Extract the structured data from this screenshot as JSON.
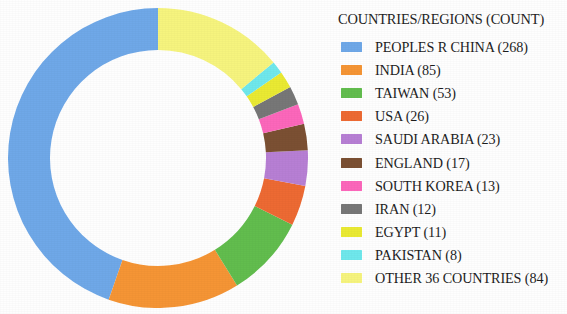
{
  "chart_data": {
    "type": "pie",
    "variant": "donut",
    "title": "COUNTRIES/REGIONS (COUNT)",
    "xlabel": "",
    "ylabel": "",
    "total": 600,
    "direction": "counterclockwise",
    "start_angle_deg": 90,
    "inner_radius_ratio": 0.72,
    "legend_position": "right",
    "grid": false,
    "categories": [
      "PEOPLES R CHINA",
      "INDIA",
      "TAIWAN",
      "USA",
      "SAUDI ARABIA",
      "ENGLAND",
      "SOUTH KOREA",
      "IRAN",
      "EGYPT",
      "PAKISTAN",
      "OTHER 36 COUNTRIES"
    ],
    "values": [
      268,
      85,
      53,
      26,
      23,
      17,
      13,
      12,
      11,
      8,
      84
    ],
    "colors": [
      "#6fa8e8",
      "#f59535",
      "#62bd4e",
      "#ed6a33",
      "#b77fd4",
      "#7b5033",
      "#fc67bb",
      "#777777",
      "#eaea33",
      "#6fe8ec",
      "#f6f47e"
    ]
  },
  "legend": {
    "title": "COUNTRIES/REGIONS (COUNT)",
    "items": [
      {
        "label": "PEOPLES R CHINA (268)",
        "color": "#6fa8e8",
        "swatch_name": "legend-swatch-peoples-r-china"
      },
      {
        "label": "INDIA (85)",
        "color": "#f59535",
        "swatch_name": "legend-swatch-india"
      },
      {
        "label": "TAIWAN (53)",
        "color": "#62bd4e",
        "swatch_name": "legend-swatch-taiwan"
      },
      {
        "label": "USA (26)",
        "color": "#ed6a33",
        "swatch_name": "legend-swatch-usa"
      },
      {
        "label": "SAUDI ARABIA (23)",
        "color": "#b77fd4",
        "swatch_name": "legend-swatch-saudi-arabia"
      },
      {
        "label": "ENGLAND (17)",
        "color": "#7b5033",
        "swatch_name": "legend-swatch-england"
      },
      {
        "label": "SOUTH KOREA (13)",
        "color": "#fc67bb",
        "swatch_name": "legend-swatch-south-korea"
      },
      {
        "label": "IRAN (12)",
        "color": "#777777",
        "swatch_name": "legend-swatch-iran"
      },
      {
        "label": "EGYPT (11)",
        "color": "#eaea33",
        "swatch_name": "legend-swatch-egypt"
      },
      {
        "label": "PAKISTAN (8)",
        "color": "#6fe8ec",
        "swatch_name": "legend-swatch-pakistan"
      },
      {
        "label": "OTHER 36 COUNTRIES (84)",
        "color": "#f6f47e",
        "swatch_name": "legend-swatch-other-36-countries"
      }
    ]
  }
}
